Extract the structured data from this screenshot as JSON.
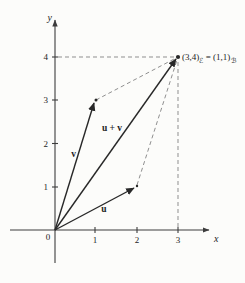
{
  "figure": {
    "type": "vector-addition-diagram",
    "background_color": "#fcfcfa",
    "axis_color": "#3c3c3c",
    "vector_color": "#282828",
    "dashed_color": "#8f8f8f",
    "axes": {
      "x_label": "x",
      "y_label": "y",
      "origin_label": "0",
      "x_ticks": [
        "1",
        "2",
        "3"
      ],
      "y_ticks": [
        "1",
        "2",
        "3",
        "4"
      ]
    },
    "vectors": [
      {
        "name": "v",
        "label": "v",
        "from": [
          0,
          0
        ],
        "to": [
          1,
          3
        ]
      },
      {
        "name": "u",
        "label": "u",
        "from": [
          0,
          0
        ],
        "to": [
          2,
          1
        ]
      },
      {
        "name": "u-plus-v",
        "label": "u + v",
        "from": [
          0,
          0
        ],
        "to": [
          3,
          4
        ]
      }
    ],
    "annotation": {
      "point_coords": "(3,4)",
      "basis_1": "ℰ",
      "equals": "= (1,1)",
      "basis_2": "ℬ"
    },
    "dashed_guides": [
      {
        "from": [
          0,
          4
        ],
        "to": [
          3,
          4
        ]
      },
      {
        "from": [
          3,
          0
        ],
        "to": [
          3,
          4
        ]
      },
      {
        "from": [
          1,
          3
        ],
        "to": [
          3,
          4
        ]
      },
      {
        "from": [
          2,
          1
        ],
        "to": [
          3,
          4
        ]
      }
    ]
  }
}
